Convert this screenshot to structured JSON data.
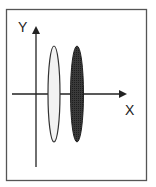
{
  "diagram": {
    "axes": {
      "x_label": "X",
      "y_label": "Y"
    },
    "shapes": [
      {
        "name": "light-ellipse",
        "fill": "#f2f2f2",
        "stroke": "#333333"
      },
      {
        "name": "dark-ellipse",
        "fill": "#333333",
        "stroke": "#222222"
      }
    ],
    "colors": {
      "frame": "#555555",
      "axis": "#222222"
    }
  }
}
